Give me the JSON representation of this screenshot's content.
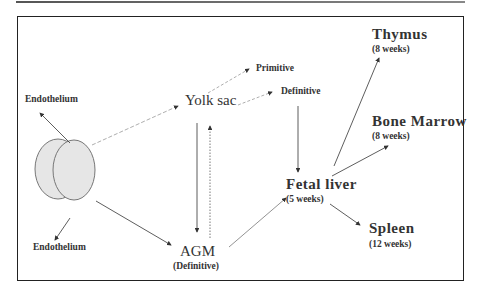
{
  "diagram": {
    "nodes": {
      "endothelium_top": "Endothelium",
      "endothelium_bottom": "Endothelium",
      "yolk_sac": "Yolk sac",
      "primitive": "Primitive",
      "definitive_yolk": "Definitive",
      "agm": "AGM",
      "agm_sub": "(Definitive)",
      "fetal_liver": "Fetal liver",
      "fetal_liver_sub": "(5 weeks)",
      "thymus": "Thymus",
      "thymus_sub": "(8 weeks)",
      "bone_marrow": "Bone Marrow",
      "bone_marrow_sub": "(8 weeks)",
      "spleen": "Spleen",
      "spleen_sub": "(12 weeks)"
    },
    "edges": [
      {
        "from": "embryo",
        "to": "endothelium_top",
        "style": "solid"
      },
      {
        "from": "embryo",
        "to": "endothelium_bottom",
        "style": "solid"
      },
      {
        "from": "embryo",
        "to": "yolk_sac",
        "style": "dashed"
      },
      {
        "from": "embryo",
        "to": "agm",
        "style": "solid"
      },
      {
        "from": "yolk_sac",
        "to": "primitive",
        "style": "dashed"
      },
      {
        "from": "yolk_sac",
        "to": "definitive_yolk",
        "style": "dashed"
      },
      {
        "from": "yolk_sac",
        "to": "agm",
        "style": "solid"
      },
      {
        "from": "agm",
        "to": "yolk_sac",
        "style": "dotted"
      },
      {
        "from": "definitive_yolk",
        "to": "fetal_liver",
        "style": "solid"
      },
      {
        "from": "agm",
        "to": "fetal_liver",
        "style": "solid"
      },
      {
        "from": "fetal_liver",
        "to": "thymus",
        "style": "solid"
      },
      {
        "from": "fetal_liver",
        "to": "bone_marrow",
        "style": "solid"
      },
      {
        "from": "fetal_liver",
        "to": "spleen",
        "style": "solid"
      }
    ],
    "colors": {
      "line": "#333333",
      "ellipse_fill": "#e6e6e6",
      "ellipse_stroke": "#777777",
      "text": "#333333"
    }
  }
}
